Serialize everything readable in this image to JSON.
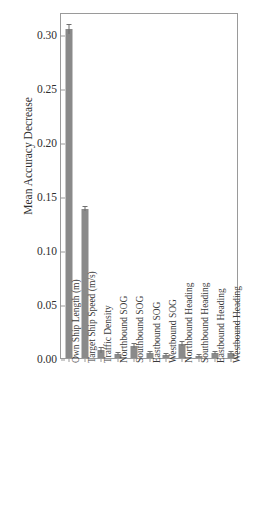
{
  "chart_data": {
    "type": "bar",
    "title": "",
    "xlabel": "",
    "ylabel": "Mean Accuracy Decrease",
    "ylim": [
      0.0,
      0.32
    ],
    "yticks": [
      "0.00",
      "0.05",
      "0.10",
      "0.15",
      "0.20",
      "0.25",
      "0.30"
    ],
    "ytick_values": [
      0.0,
      0.05,
      0.1,
      0.15,
      0.2,
      0.25,
      0.3
    ],
    "grid": false,
    "legend": "none",
    "bar_color": "#8a8a8a",
    "error_bar_color": "#6f6f6f",
    "categories": [
      "Own Ship Length (m)",
      "Target Ship Speed (m/s)",
      "Traffic Density",
      "Northbound SOG",
      "Southbound SOG",
      "Eastbound SOG",
      "Westbound SOG",
      "Northbound Heading",
      "Southbound Heading",
      "Eastbound Heading",
      "Westbound Heading"
    ],
    "values": [
      0.304,
      0.138,
      0.007,
      0.004,
      0.011,
      0.005,
      0.003,
      0.013,
      0.002,
      0.005,
      0.005
    ],
    "errors": [
      0.004,
      0.002,
      0.002,
      0.001,
      0.002,
      0.001,
      0.001,
      0.002,
      0.001,
      0.001,
      0.001
    ]
  }
}
